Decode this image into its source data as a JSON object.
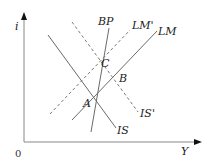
{
  "diagram": {
    "type": "IS-LM-BP model",
    "axes": {
      "y_label": "i",
      "x_label": "Y",
      "origin_label": "0"
    },
    "curves": [
      {
        "name": "IS",
        "label": "IS",
        "style": "solid"
      },
      {
        "name": "IS_prime",
        "label": "IS'",
        "style": "dashed"
      },
      {
        "name": "LM",
        "label": "LM",
        "style": "solid"
      },
      {
        "name": "LM_prime",
        "label": "LM'",
        "style": "dashed"
      },
      {
        "name": "BP",
        "label": "BP",
        "style": "solid"
      }
    ],
    "points": [
      {
        "name": "A",
        "label": "A"
      },
      {
        "name": "B",
        "label": "B"
      },
      {
        "name": "C",
        "label": "C"
      }
    ]
  }
}
